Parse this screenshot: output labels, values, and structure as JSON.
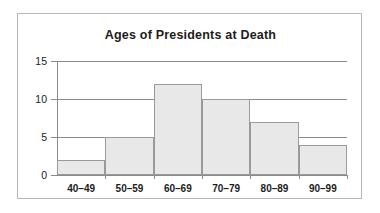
{
  "chart_data": {
    "type": "bar",
    "title": "Ages of Presidents at Death",
    "xlabel": "",
    "ylabel": "",
    "categories": [
      "40–49",
      "50–59",
      "60–69",
      "70–79",
      "80–89",
      "90–99"
    ],
    "values": [
      2,
      5,
      12,
      10,
      7,
      4
    ],
    "ylim": [
      0,
      15
    ],
    "yticks": [
      0,
      5,
      10,
      15
    ],
    "ytick_labels": [
      "0",
      "5",
      "10",
      "15"
    ],
    "grid": "horizontal",
    "legend": "none",
    "bar_fill_color": "#e8e8e8",
    "bar_edge_color": "#9a9a9a",
    "axis_color": "#8a8a8a",
    "text_color": "#1c1c1c",
    "background_color": "#ffffff",
    "frame_color": "#b9b9b9"
  }
}
